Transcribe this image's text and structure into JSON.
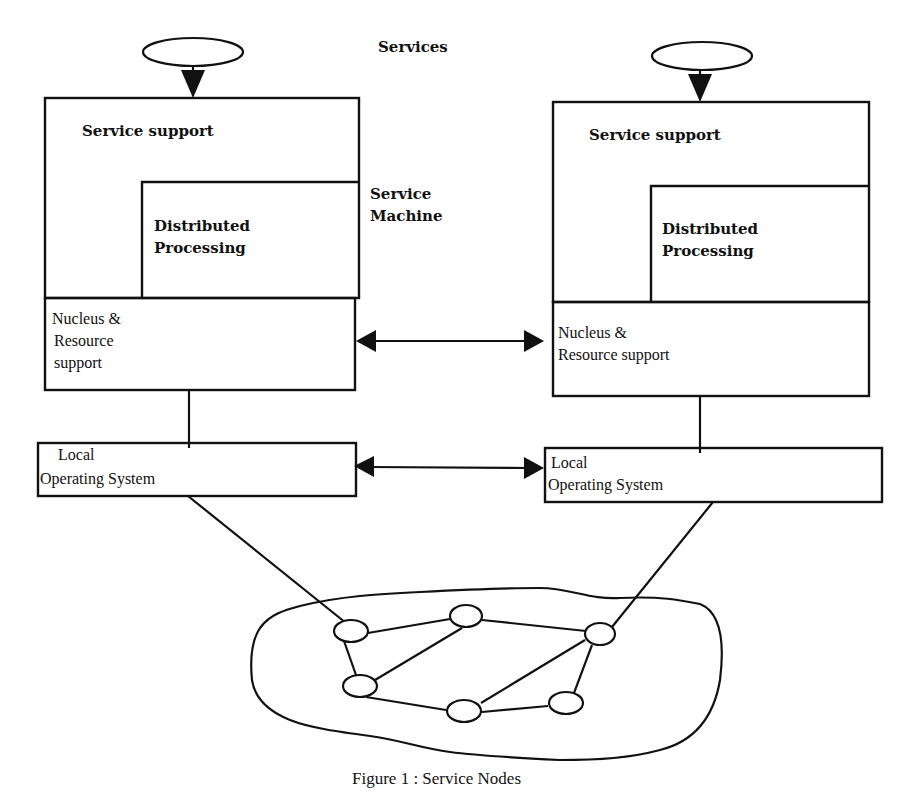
{
  "diagram": {
    "title": "Services",
    "service_machine_label": [
      "Service",
      "Machine"
    ],
    "left_node": {
      "service_support": "Service support",
      "distributed_processing": [
        "Distributed",
        "Processing"
      ],
      "nucleus": [
        "Nucleus &",
        "Resource",
        "support"
      ],
      "local_os": [
        "Local",
        "Operating System"
      ]
    },
    "right_node": {
      "service_support": "Service support",
      "distributed_processing": [
        "Distributed",
        "Processing"
      ],
      "nucleus": [
        "Nucleus &",
        "Resource support"
      ],
      "local_os": [
        "Local",
        "Operating System"
      ]
    },
    "network": {
      "node_count": 6
    },
    "caption": "Figure 1 : Service Nodes"
  }
}
